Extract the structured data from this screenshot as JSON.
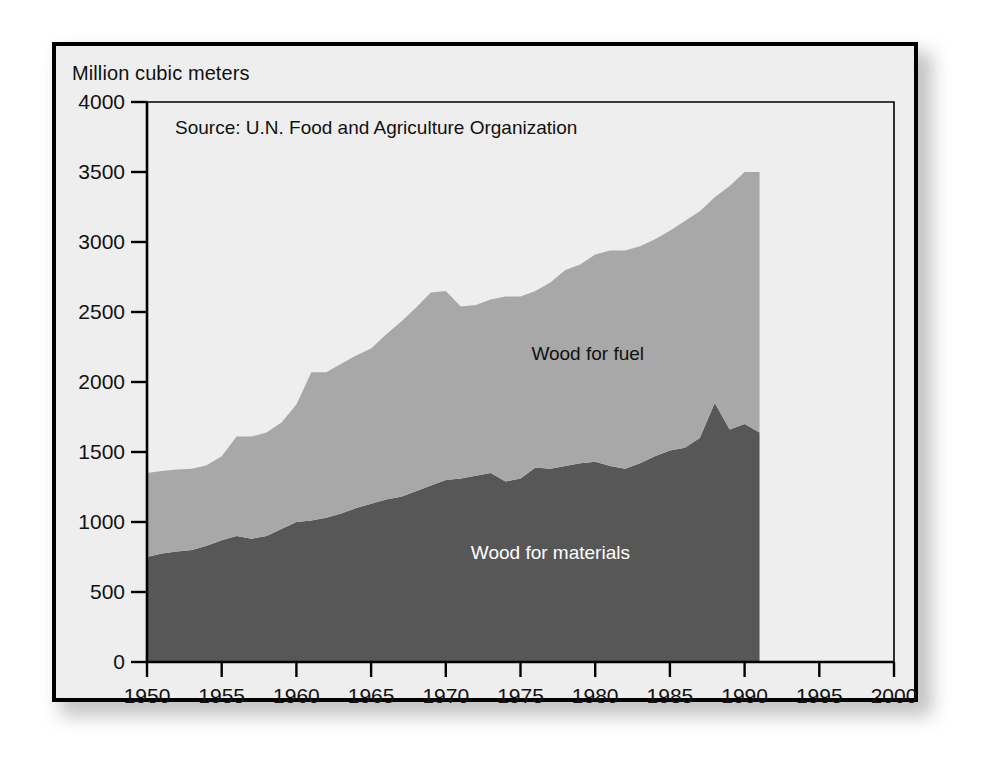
{
  "figure": {
    "y_axis_caption": "Million cubic meters",
    "source_note": "Source: U.N. Food and Agriculture Organization",
    "background_color": "#eeeeee",
    "border_color": "#000000",
    "axis_color": "#000000"
  },
  "chart_data": {
    "type": "area",
    "stacked": true,
    "title": "",
    "subtitle": "",
    "annotations": [
      "Source: U.N. Food and Agriculture Organization"
    ],
    "xlabel": "",
    "ylabel": "Million cubic meters",
    "xlim": [
      1950,
      2000
    ],
    "ylim": [
      0,
      4000
    ],
    "grid": false,
    "legend_position": "inside-plot-labels",
    "x_ticks": [
      1950,
      1955,
      1960,
      1965,
      1970,
      1975,
      1980,
      1985,
      1990,
      1995,
      2000
    ],
    "y_ticks": [
      0,
      500,
      1000,
      1500,
      2000,
      2500,
      3000,
      3500,
      4000
    ],
    "x": [
      1950,
      1951,
      1952,
      1953,
      1954,
      1955,
      1956,
      1957,
      1958,
      1959,
      1960,
      1961,
      1962,
      1963,
      1964,
      1965,
      1966,
      1967,
      1968,
      1969,
      1970,
      1971,
      1972,
      1973,
      1974,
      1975,
      1976,
      1977,
      1978,
      1979,
      1980,
      1981,
      1982,
      1983,
      1984,
      1985,
      1986,
      1987,
      1988,
      1989,
      1990,
      1991
    ],
    "series": [
      {
        "name": "Wood for materials",
        "color": "#575757",
        "label_color": "#ffffff",
        "values": [
          750,
          775,
          790,
          800,
          830,
          870,
          900,
          880,
          900,
          950,
          1000,
          1010,
          1030,
          1060,
          1100,
          1130,
          1160,
          1180,
          1220,
          1260,
          1300,
          1310,
          1330,
          1350,
          1290,
          1310,
          1390,
          1380,
          1400,
          1420,
          1430,
          1400,
          1380,
          1420,
          1470,
          1510,
          1530,
          1600,
          1850,
          1660,
          1700,
          1640
        ]
      },
      {
        "name": "Wood for fuel",
        "color": "#a8a8a8",
        "label_color": "#111111",
        "values": [
          600,
          590,
          585,
          580,
          575,
          600,
          710,
          730,
          740,
          760,
          840,
          1060,
          1040,
          1070,
          1090,
          1110,
          1180,
          1250,
          1310,
          1380,
          1350,
          1230,
          1220,
          1240,
          1320,
          1300,
          1260,
          1330,
          1400,
          1420,
          1480,
          1540,
          1560,
          1550,
          1550,
          1570,
          1620,
          1620,
          1470,
          1740,
          1800,
          1860
        ]
      }
    ],
    "totals": [
      1350,
      1365,
      1375,
      1380,
      1405,
      1470,
      1610,
      1610,
      1640,
      1710,
      1840,
      2070,
      2070,
      2130,
      2190,
      2240,
      2340,
      2430,
      2530,
      2640,
      2650,
      2540,
      2550,
      2590,
      2610,
      2610,
      2650,
      2710,
      2800,
      2840,
      2910,
      2940,
      2940,
      2970,
      3020,
      3080,
      3150,
      3220,
      3320,
      3400,
      3500,
      3500
    ]
  }
}
